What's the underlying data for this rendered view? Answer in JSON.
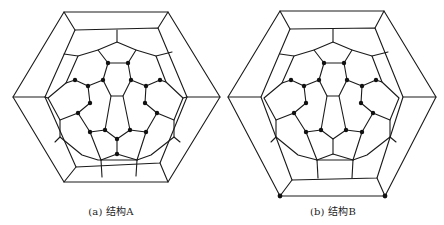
{
  "figure": {
    "panels": [
      {
        "id": "a",
        "caption": "(a) 结构A",
        "marked_nodes": "inner-ring",
        "description": "Hexagonal outer frame with fullerene-like inner graph; 20 marked vertices around the inner ring including two at the bottom center"
      },
      {
        "id": "b",
        "caption": "(b) 结构B",
        "marked_nodes": "inner-ring-plus-outer-bottom-corners",
        "description": "Same hexagonal framework; 18 marked inner vertices plus 2 marked outer bottom-corner vertices"
      }
    ],
    "colors": {
      "edge": "#1a1a1a",
      "node": "#111111",
      "background": "#ffffff"
    }
  }
}
